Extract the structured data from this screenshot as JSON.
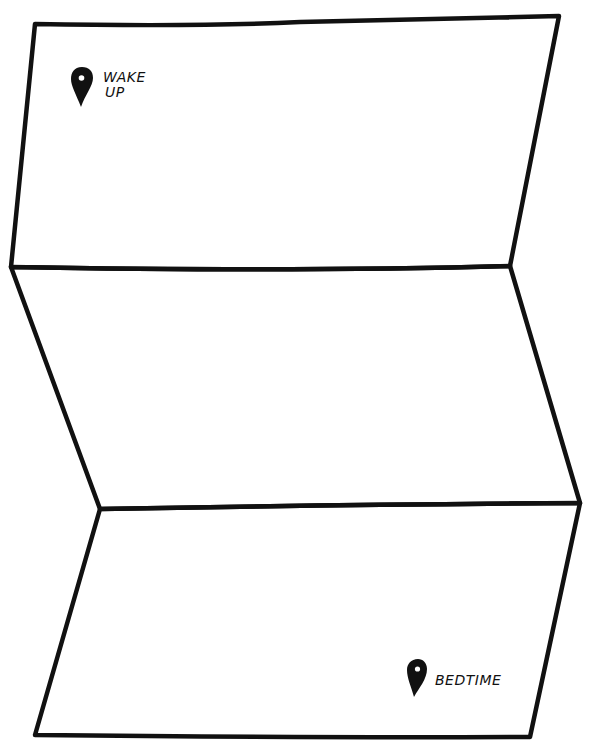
{
  "diagram": {
    "type": "folded-map",
    "panels": 3,
    "line_color": "#111111",
    "background": "#ffffff"
  },
  "markers": [
    {
      "id": "start",
      "icon": "map-pin-icon",
      "label_line1": "WAKE",
      "label_line2": "UP"
    },
    {
      "id": "end",
      "icon": "map-pin-icon",
      "label_line1": "BEDTIME"
    }
  ]
}
